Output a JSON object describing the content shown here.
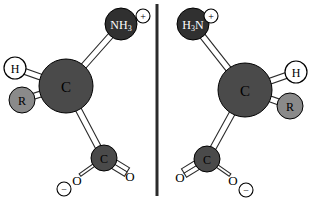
{
  "figure": {
    "background_color": "#ffffff"
  },
  "colors": {
    "sphere_nitrogen": "#303030",
    "sphere_carbon": "#4a4a4a",
    "sphere_carboxyl_carbon": "#4a4a4a",
    "sphere_r_group": "#8a8a8a",
    "sphere_hydrogen": "#ffffff",
    "bond_outline": "#2b2b2b",
    "bond_fill": "#ffffff",
    "text_dark": "#000000",
    "text_light": "#ffffff",
    "mirror_line": "#2b2b2b"
  },
  "mirror_plane": {
    "name": "mirror-plane-divider",
    "x": 157,
    "y_top": 4,
    "y_bottom": 196,
    "width": 3
  },
  "molecules": [
    {
      "id": "left",
      "name": "left-enantiomer",
      "description": "L configuration drawn with ammonium up-right, hydrogen upper-left, R group left, carboxylate lower-right",
      "atoms": [
        {
          "id": "left-ammonium",
          "name": "ammonium-group",
          "label": "NH",
          "subscript": "3",
          "cx": 121,
          "cy": 24,
          "r": 16,
          "fill_key": "sphere_nitrogen",
          "text_key": "text_light",
          "font_size": 12,
          "charge": {
            "sign": "+",
            "cx": 143,
            "cy": 16,
            "r": 7
          }
        },
        {
          "id": "left-alpha-carbon",
          "name": "alpha-carbon-atom",
          "label": "C",
          "subscript": "",
          "cx": 66,
          "cy": 86,
          "r": 27,
          "fill_key": "sphere_carbon",
          "text_key": "text_dark",
          "font_size": 15,
          "charge": null
        },
        {
          "id": "left-hydrogen",
          "name": "hydrogen-atom",
          "label": "H",
          "subscript": "",
          "cx": 15,
          "cy": 68,
          "r": 11,
          "fill_key": "sphere_hydrogen",
          "text_key": "text_dark",
          "font_size": 12,
          "charge": null
        },
        {
          "id": "left-r-group",
          "name": "r-substituent-atom",
          "label": "R",
          "subscript": "",
          "cx": 22,
          "cy": 100,
          "r": 13,
          "fill_key": "sphere_r_group",
          "text_key": "text_dark",
          "font_size": 12,
          "charge": null
        },
        {
          "id": "left-carboxyl-carbon",
          "name": "carboxyl-carbon-atom",
          "label": "C",
          "subscript": "",
          "cx": 104,
          "cy": 158,
          "r": 13,
          "fill_key": "sphere_carboxyl_carbon",
          "text_key": "text_dark",
          "font_size": 12,
          "charge": null
        }
      ],
      "text_atoms": [
        {
          "id": "left-oxygen-double",
          "name": "carbonyl-oxygen-label",
          "label": "O",
          "x": 130,
          "y": 176,
          "font_size": 13,
          "charge": null
        },
        {
          "id": "left-oxygen-single",
          "name": "carboxylate-oxygen-label",
          "label": "O",
          "x": 77,
          "y": 180,
          "font_size": 13,
          "charge": {
            "sign": "−",
            "cx": 64,
            "cy": 189,
            "r": 7
          }
        }
      ],
      "bonds": [
        {
          "id": "left-bond-ca-n",
          "name": "bond-alpha-carbon-to-ammonium",
          "x1": 66,
          "y1": 86,
          "x2": 121,
          "y2": 24,
          "order": 1,
          "width": 6
        },
        {
          "id": "left-bond-ca-h",
          "name": "bond-alpha-carbon-to-hydrogen",
          "x1": 66,
          "y1": 86,
          "x2": 15,
          "y2": 68,
          "order": 1,
          "width": 6
        },
        {
          "id": "left-bond-ca-r",
          "name": "bond-alpha-carbon-to-r-group",
          "x1": 66,
          "y1": 86,
          "x2": 22,
          "y2": 100,
          "order": 1,
          "width": 6
        },
        {
          "id": "left-bond-ca-cooh",
          "name": "bond-alpha-carbon-to-carboxyl-carbon",
          "x1": 66,
          "y1": 86,
          "x2": 104,
          "y2": 158,
          "order": 1,
          "width": 6
        },
        {
          "id": "left-bond-c-o-double",
          "name": "double-bond-carboxyl-to-oxygen",
          "x1": 104,
          "y1": 158,
          "x2": 127,
          "y2": 172,
          "order": 2,
          "width": 5
        },
        {
          "id": "left-bond-c-o-single",
          "name": "single-bond-carboxyl-to-oxygen",
          "x1": 104,
          "y1": 158,
          "x2": 80,
          "y2": 175,
          "order": 1,
          "width": 3
        }
      ]
    },
    {
      "id": "right",
      "name": "right-enantiomer",
      "description": "D configuration, mirror image of left: ammonium up-left, hydrogen upper-right, R group right, carboxylate lower-left",
      "atoms": [
        {
          "id": "right-ammonium",
          "name": "ammonium-group",
          "label": "H",
          "subscript": "3",
          "label_suffix": "N",
          "cx": 193,
          "cy": 24,
          "r": 16,
          "fill_key": "sphere_nitrogen",
          "text_key": "text_light",
          "font_size": 12,
          "charge": {
            "sign": "+",
            "cx": 211,
            "cy": 16,
            "r": 7
          }
        },
        {
          "id": "right-alpha-carbon",
          "name": "alpha-carbon-atom",
          "label": "C",
          "subscript": "",
          "cx": 245,
          "cy": 90,
          "r": 27,
          "fill_key": "sphere_carbon",
          "text_key": "text_dark",
          "font_size": 15,
          "charge": null
        },
        {
          "id": "right-hydrogen",
          "name": "hydrogen-atom",
          "label": "H",
          "subscript": "",
          "cx": 296,
          "cy": 72,
          "r": 11,
          "fill_key": "sphere_hydrogen",
          "text_key": "text_dark",
          "font_size": 12,
          "charge": null
        },
        {
          "id": "right-r-group",
          "name": "r-substituent-atom",
          "label": "R",
          "subscript": "",
          "cx": 290,
          "cy": 106,
          "r": 13,
          "fill_key": "sphere_r_group",
          "text_key": "text_dark",
          "font_size": 12,
          "charge": null
        },
        {
          "id": "right-carboxyl-carbon",
          "name": "carboxyl-carbon-atom",
          "label": "C",
          "subscript": "",
          "cx": 207,
          "cy": 159,
          "r": 13,
          "fill_key": "sphere_carboxyl_carbon",
          "text_key": "text_dark",
          "font_size": 12,
          "charge": null
        }
      ],
      "text_atoms": [
        {
          "id": "right-oxygen-double",
          "name": "carbonyl-oxygen-label",
          "label": "O",
          "x": 180,
          "y": 177,
          "font_size": 13,
          "charge": null
        },
        {
          "id": "right-oxygen-single",
          "name": "carboxylate-oxygen-label",
          "label": "O",
          "x": 233,
          "y": 180,
          "font_size": 13,
          "charge": {
            "sign": "−",
            "cx": 246,
            "cy": 190,
            "r": 7
          }
        }
      ],
      "bonds": [
        {
          "id": "right-bond-ca-n",
          "name": "bond-alpha-carbon-to-ammonium",
          "x1": 245,
          "y1": 90,
          "x2": 193,
          "y2": 24,
          "order": 1,
          "width": 6
        },
        {
          "id": "right-bond-ca-h",
          "name": "bond-alpha-carbon-to-hydrogen",
          "x1": 245,
          "y1": 90,
          "x2": 296,
          "y2": 72,
          "order": 1,
          "width": 6
        },
        {
          "id": "right-bond-ca-r",
          "name": "bond-alpha-carbon-to-r-group",
          "x1": 245,
          "y1": 90,
          "x2": 290,
          "y2": 106,
          "order": 1,
          "width": 6
        },
        {
          "id": "right-bond-ca-cooh",
          "name": "bond-alpha-carbon-to-carboxyl-carbon",
          "x1": 245,
          "y1": 90,
          "x2": 207,
          "y2": 159,
          "order": 1,
          "width": 6
        },
        {
          "id": "right-bond-c-o-double",
          "name": "double-bond-carboxyl-to-oxygen",
          "x1": 207,
          "y1": 159,
          "x2": 184,
          "y2": 173,
          "order": 2,
          "width": 5
        },
        {
          "id": "right-bond-c-o-single",
          "name": "single-bond-carboxyl-to-oxygen",
          "x1": 207,
          "y1": 159,
          "x2": 230,
          "y2": 175,
          "order": 1,
          "width": 3
        }
      ]
    }
  ]
}
